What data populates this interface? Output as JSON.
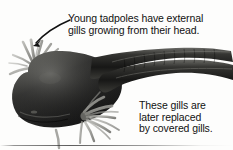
{
  "figure": {
    "background_color": "#fdfdfc",
    "ink_color": "#111111",
    "body_dark": "#1b1b1b",
    "body_mid": "#4a4a4a",
    "gill_gray": "#9a9a96"
  },
  "annotations": {
    "top": {
      "lines": [
        "Young tadpoles have external",
        "gills growing from their head."
      ]
    },
    "bottom": {
      "lines": [
        "These gills are",
        "later replaced",
        "by covered gills."
      ]
    }
  },
  "arrow": {
    "label": "pointer-to-head-gills",
    "from": "70,20",
    "to": "33,45"
  }
}
